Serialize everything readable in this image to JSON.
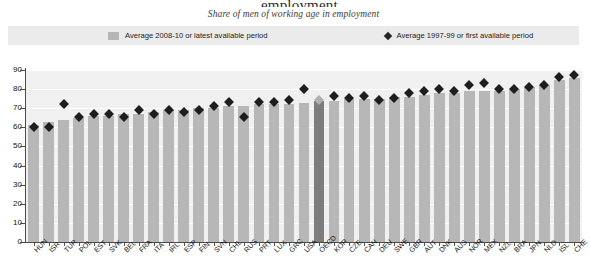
{
  "title": "...employment",
  "subtitle": "Share of men of working age in employment",
  "legend": {
    "bars_label": "Average 2008-10 or latest available period",
    "diamonds_label": "Average 1997-99 or first available period",
    "bar_color": "#b6b6b6",
    "diamond_color": "#262626"
  },
  "chart_data": {
    "type": "bar",
    "title": "...employment",
    "subtitle": "Share of men of working age in employment",
    "xlabel": "",
    "ylabel": "",
    "ylim": [
      0,
      90
    ],
    "yticks": [
      0,
      10,
      20,
      30,
      40,
      50,
      60,
      70,
      80,
      90
    ],
    "grid": true,
    "legend_position": "top",
    "highlight_category": "OECD",
    "highlight_bar_color": "#7d7d7d",
    "highlight_marker_color": "#b0b0b0",
    "categories": [
      "HUN",
      "ISR",
      "TUR",
      "POL",
      "EST",
      "SVK",
      "BEL",
      "FRA",
      "ITA",
      "IRL",
      "ESP",
      "FIN",
      "SVN",
      "CHL",
      "RUS",
      "PRT",
      "LUX",
      "GRC",
      "USA",
      "OECD",
      "KOR",
      "CZE",
      "CAN",
      "DEU",
      "SWE",
      "GBR",
      "AUT",
      "DNK",
      "AUS",
      "NOR",
      "MEX",
      "NZL",
      "BRA",
      "JPN",
      "NLD",
      "ISL",
      "CHE"
    ],
    "series": [
      {
        "name": "Average 2008-10 or latest available period",
        "type": "bar",
        "values": [
          61,
          63,
          64,
          65,
          66,
          66,
          67,
          67,
          68,
          69,
          69,
          70,
          70,
          71,
          71,
          72,
          72,
          72,
          73,
          74,
          74,
          75,
          75,
          75,
          76,
          76,
          77,
          78,
          78,
          79,
          79,
          79,
          80,
          81,
          82,
          85,
          86
        ]
      },
      {
        "name": "Average 1997-99 or first available period",
        "type": "scatter-marker",
        "marker": "diamond",
        "values": [
          62,
          62,
          74,
          67,
          69,
          69,
          67,
          71,
          69,
          71,
          70,
          71,
          73,
          75,
          67,
          75,
          75,
          76,
          82,
          76,
          78,
          77,
          78,
          76,
          77,
          80,
          81,
          82,
          81,
          84,
          85,
          82,
          82,
          83,
          84,
          88,
          89
        ]
      }
    ]
  }
}
